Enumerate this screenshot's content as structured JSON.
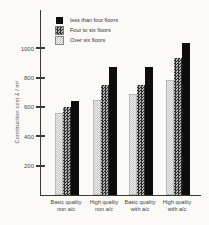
{
  "figure": {
    "ylabel": "Construction cost £ / m²",
    "legend": [
      {
        "label": "less than four floors",
        "pattern": "solid-black"
      },
      {
        "label": "Four to six floors",
        "pattern": "dark-check"
      },
      {
        "label": "Over six floors",
        "pattern": "light-stipple"
      }
    ],
    "colors": {
      "bar_black": "#0d0d0d",
      "axis": "#3a3a3a",
      "background": "#fbfaf7"
    }
  },
  "chart_data": {
    "type": "bar",
    "title": "",
    "xlabel": "",
    "ylabel": "Construction cost £ / m²",
    "categories": [
      "Basic quality non a/c",
      "High quality non a/c",
      "Basic quality with a/c",
      "High quality with a/c"
    ],
    "categories_lines": [
      [
        "Basic quality",
        "non a/c"
      ],
      [
        "High quality",
        "non a/c"
      ],
      [
        "Basic quality",
        "with a/c"
      ],
      [
        "High quality",
        "with a/c"
      ]
    ],
    "series": [
      {
        "name": "Over six floors",
        "pattern": "light-stipple",
        "values": [
          560,
          650,
          690,
          780
        ]
      },
      {
        "name": "Four to six floors",
        "pattern": "dark-check",
        "values": [
          600,
          750,
          750,
          930
        ]
      },
      {
        "name": "less than four floors",
        "pattern": "solid-black",
        "values": [
          640,
          870,
          870,
          1035
        ]
      }
    ],
    "yticks": [
      200,
      400,
      600,
      800,
      1000
    ],
    "ylim": [
      0,
      1260
    ],
    "grid": false,
    "legend_position": "upper-left"
  }
}
